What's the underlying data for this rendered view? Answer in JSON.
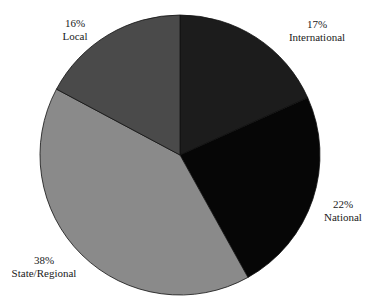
{
  "chart_data": {
    "type": "pie",
    "title": "",
    "start_angle_deg": 0,
    "direction": "clockwise",
    "slices": [
      {
        "label": "International",
        "value": 17,
        "display": "17%",
        "color": "#1c1c1c"
      },
      {
        "label": "National",
        "value": 22,
        "display": "22%",
        "color": "#060606"
      },
      {
        "label": "State/Regional",
        "value": 38,
        "display": "38%",
        "color": "#8a8a8a"
      },
      {
        "label": "Local",
        "value": 16,
        "display": "16%",
        "color": "#4a4a4a"
      }
    ],
    "legend": "none",
    "labels_outside": true
  },
  "labels": {
    "international": {
      "pct": "17%",
      "name": "International"
    },
    "national": {
      "pct": "22%",
      "name": "National"
    },
    "state": {
      "pct": "38%",
      "name": "State/Regional"
    },
    "local": {
      "pct": "16%",
      "name": "Local"
    }
  }
}
